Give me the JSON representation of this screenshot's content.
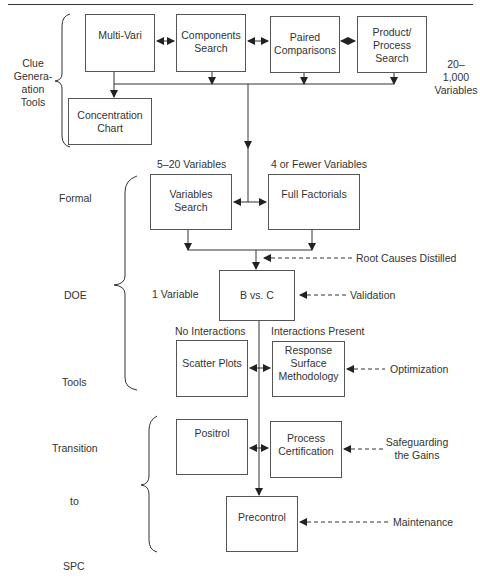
{
  "boxes": {
    "multi_vari": "Multi-Vari",
    "components_search": [
      "Components",
      "Search"
    ],
    "paired_comparisons": [
      "Paired",
      "Comparisons"
    ],
    "product_process_search": [
      "Product/",
      "Process",
      "Search"
    ],
    "concentration_chart": [
      "Concentration",
      "Chart"
    ],
    "variables_search": [
      "Variables",
      "Search"
    ],
    "full_factorials": "Full Factorials",
    "b_vs_c": "B vs. C",
    "scatter_plots": "Scatter Plots",
    "response_surface": [
      "Response",
      "Surface",
      "Methodology"
    ],
    "positrol": "Positrol",
    "process_certification": [
      "Process",
      "Certification"
    ],
    "precontrol": "Precontrol"
  },
  "stage_labels": {
    "clue_generation": [
      "Clue",
      "Genera-",
      "ation",
      "Tools"
    ],
    "formal": "Formal",
    "doe": "DOE",
    "tools": "Tools",
    "transition": "Transition",
    "to": "to",
    "spc": "SPC"
  },
  "annotations": {
    "variables_20_1000": [
      "20–",
      "1,000",
      "Variables"
    ],
    "variables_5_20": "5–20 Variables",
    "variables_4_fewer": "4 or Fewer Variables",
    "one_variable": "1 Variable",
    "no_interactions": "No Interactions",
    "interactions_present": "Interactions Present",
    "root_causes": "Root Causes Distilled",
    "validation": "Validation",
    "optimization": "Optimization",
    "safeguarding": [
      "Safeguarding",
      "the Gains"
    ],
    "maintenance": "Maintenance"
  }
}
